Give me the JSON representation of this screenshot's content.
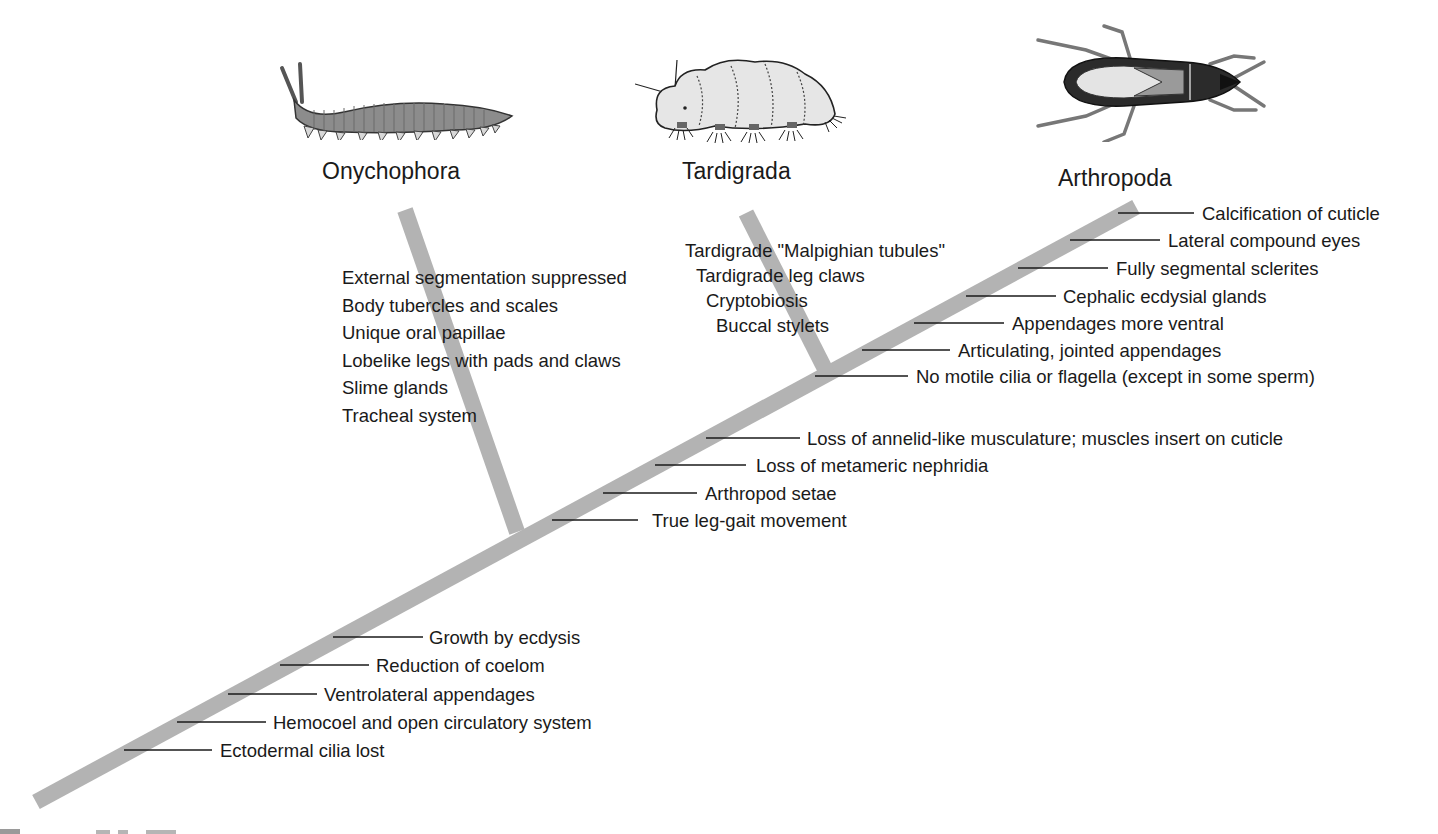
{
  "figure": {
    "type": "cladogram",
    "trunk_color": "#b3b3b3",
    "line_color": "#1a1a1a"
  },
  "taxa": [
    {
      "name": "Onychophora",
      "illustration": "velvet-worm-illustration"
    },
    {
      "name": "Tardigrada",
      "illustration": "tardigrade-illustration"
    },
    {
      "name": "Arthropoda",
      "illustration": "insect-bug-illustration"
    }
  ],
  "onychophora_characters": [
    "External segmentation suppressed",
    "Body tubercles and scales",
    "Unique oral papillae",
    "Lobelike legs with pads and claws",
    "Slime glands",
    "Tracheal system"
  ],
  "tardigrada_characters": [
    "Tardigrade \"Malpighian tubules\"",
    "Tardigrade leg claws",
    "Cryptobiosis",
    "Buccal stylets"
  ],
  "arthropoda_characters": [
    "Calcification of cuticle",
    "Lateral compound eyes",
    "Fully segmental sclerites",
    "Cephalic ecdysial glands",
    "Appendages more ventral",
    "Articulating, jointed appendages",
    "No motile cilia or flagella (except in some sperm)"
  ],
  "arthropod_tardigrade_characters": [
    "Loss of annelid-like musculature; muscles insert on cuticle",
    "Loss of metameric nephridia",
    "Arthropod setae",
    "True leg-gait movement"
  ],
  "panarthropod_characters": [
    "Growth by ecdysis",
    "Reduction of coelom",
    "Ventrolateral appendages",
    "Hemocoel and open circulatory system",
    "Ectodermal cilia lost"
  ]
}
